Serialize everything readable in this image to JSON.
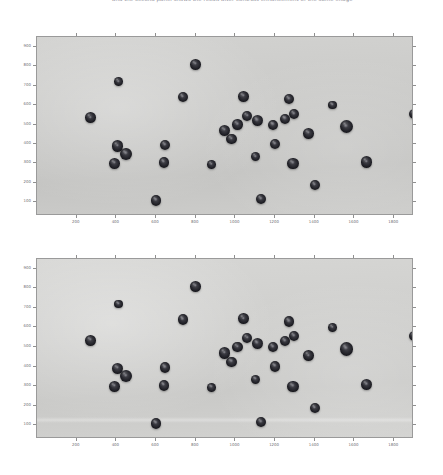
{
  "caption": {
    "text": "and the second panel shows the result after contrast enhancement of the same image"
  },
  "figure": {
    "type": "image-with-axes",
    "panel_count": 2,
    "background_color": "#ffffff",
    "image_background_color": "#cacac8",
    "object_color": "#1e1e24",
    "axis_color": "#8f8f8f",
    "tick_label_color": "#6e6e74"
  },
  "chart_data": {
    "type": "scatter",
    "title": "",
    "xlabel": "",
    "ylabel": "",
    "grid": false,
    "legend": "none",
    "xlim": [
      0,
      1900
    ],
    "ylim": [
      950,
      30
    ],
    "xticks": [
      200,
      400,
      600,
      800,
      1000,
      1200,
      1400,
      1600,
      1800
    ],
    "yticks": [
      100,
      200,
      300,
      400,
      500,
      600,
      700,
      800,
      900
    ],
    "xtick_labels": [
      "200",
      "400",
      "600",
      "800",
      "1000",
      "1200",
      "1400",
      "1600",
      "1800"
    ],
    "ytick_labels": [
      "100",
      "200",
      "300",
      "400",
      "500",
      "600",
      "700",
      "800",
      "900"
    ],
    "panels": [
      {
        "name": "original-image",
        "index": 1,
        "object_count": 36,
        "objects": [
          {
            "x": 600,
            "y": 110,
            "r": 27
          },
          {
            "x": 1130,
            "y": 118,
            "r": 25
          },
          {
            "x": 1400,
            "y": 188,
            "r": 25
          },
          {
            "x": 390,
            "y": 300,
            "r": 27
          },
          {
            "x": 450,
            "y": 350,
            "r": 30
          },
          {
            "x": 405,
            "y": 390,
            "r": 28
          },
          {
            "x": 640,
            "y": 305,
            "r": 27
          },
          {
            "x": 645,
            "y": 395,
            "r": 26
          },
          {
            "x": 880,
            "y": 295,
            "r": 22
          },
          {
            "x": 1100,
            "y": 335,
            "r": 24
          },
          {
            "x": 1290,
            "y": 300,
            "r": 28
          },
          {
            "x": 1660,
            "y": 308,
            "r": 29
          },
          {
            "x": 1200,
            "y": 400,
            "r": 27
          },
          {
            "x": 980,
            "y": 425,
            "r": 26
          },
          {
            "x": 1370,
            "y": 455,
            "r": 27
          },
          {
            "x": 945,
            "y": 470,
            "r": 29
          },
          {
            "x": 1010,
            "y": 500,
            "r": 26
          },
          {
            "x": 1060,
            "y": 545,
            "r": 25
          },
          {
            "x": 1560,
            "y": 490,
            "r": 33
          },
          {
            "x": 1190,
            "y": 500,
            "r": 25
          },
          {
            "x": 1250,
            "y": 530,
            "r": 26
          },
          {
            "x": 1295,
            "y": 555,
            "r": 25
          },
          {
            "x": 1110,
            "y": 520,
            "r": 28
          },
          {
            "x": 270,
            "y": 535,
            "r": 27
          },
          {
            "x": 1490,
            "y": 600,
            "r": 22
          },
          {
            "x": 1900,
            "y": 555,
            "r": 26
          },
          {
            "x": 1270,
            "y": 630,
            "r": 26
          },
          {
            "x": 1040,
            "y": 645,
            "r": 27
          },
          {
            "x": 735,
            "y": 640,
            "r": 26
          },
          {
            "x": 410,
            "y": 720,
            "r": 22
          },
          {
            "x": 800,
            "y": 810,
            "r": 27
          }
        ]
      },
      {
        "name": "contrast-enhanced-image",
        "index": 2,
        "object_count": 36,
        "objects": [
          {
            "x": 600,
            "y": 110,
            "r": 27
          },
          {
            "x": 1130,
            "y": 118,
            "r": 25
          },
          {
            "x": 1400,
            "y": 188,
            "r": 25
          },
          {
            "x": 390,
            "y": 300,
            "r": 27
          },
          {
            "x": 450,
            "y": 350,
            "r": 30
          },
          {
            "x": 405,
            "y": 390,
            "r": 28
          },
          {
            "x": 640,
            "y": 305,
            "r": 27
          },
          {
            "x": 645,
            "y": 395,
            "r": 26
          },
          {
            "x": 880,
            "y": 295,
            "r": 22
          },
          {
            "x": 1100,
            "y": 335,
            "r": 24
          },
          {
            "x": 1290,
            "y": 300,
            "r": 28
          },
          {
            "x": 1660,
            "y": 308,
            "r": 29
          },
          {
            "x": 1200,
            "y": 400,
            "r": 27
          },
          {
            "x": 980,
            "y": 425,
            "r": 26
          },
          {
            "x": 1370,
            "y": 455,
            "r": 27
          },
          {
            "x": 945,
            "y": 470,
            "r": 29
          },
          {
            "x": 1010,
            "y": 500,
            "r": 26
          },
          {
            "x": 1060,
            "y": 545,
            "r": 25
          },
          {
            "x": 1560,
            "y": 490,
            "r": 33
          },
          {
            "x": 1190,
            "y": 500,
            "r": 25
          },
          {
            "x": 1250,
            "y": 530,
            "r": 26
          },
          {
            "x": 1295,
            "y": 555,
            "r": 25
          },
          {
            "x": 1110,
            "y": 520,
            "r": 28
          },
          {
            "x": 270,
            "y": 535,
            "r": 27
          },
          {
            "x": 1490,
            "y": 600,
            "r": 22
          },
          {
            "x": 1900,
            "y": 555,
            "r": 26
          },
          {
            "x": 1270,
            "y": 630,
            "r": 26
          },
          {
            "x": 1040,
            "y": 645,
            "r": 27
          },
          {
            "x": 735,
            "y": 640,
            "r": 26
          },
          {
            "x": 410,
            "y": 720,
            "r": 22
          },
          {
            "x": 800,
            "y": 810,
            "r": 27
          }
        ]
      }
    ]
  }
}
